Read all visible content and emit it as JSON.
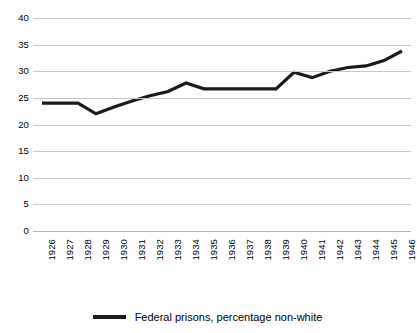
{
  "chart_data": {
    "type": "line",
    "title": "",
    "xlabel": "",
    "ylabel": "",
    "grid": true,
    "legend_position": "bottom-center",
    "ylim": [
      0,
      40
    ],
    "y_ticks": [
      0,
      5,
      10,
      15,
      20,
      25,
      30,
      35,
      40
    ],
    "categories": [
      "1926",
      "1927",
      "1928",
      "1929",
      "1930",
      "1931",
      "1932",
      "1933",
      "1934",
      "1935",
      "1936",
      "1937",
      "1938",
      "1939",
      "1940",
      "1941",
      "1942",
      "1943",
      "1944",
      "1945",
      "1946"
    ],
    "series": [
      {
        "name": "Federal prisons, percentage non-white",
        "color": "#1a1a1a",
        "values": [
          24.0,
          24.0,
          24.0,
          22.0,
          23.3,
          24.4,
          25.4,
          26.2,
          27.8,
          26.7,
          26.7,
          26.7,
          26.7,
          26.7,
          29.8,
          28.8,
          30.0,
          30.7,
          31.0,
          32.0,
          33.8
        ]
      }
    ]
  },
  "legend": {
    "entries": [
      {
        "label": "Federal prisons, percentage non-white"
      }
    ]
  }
}
